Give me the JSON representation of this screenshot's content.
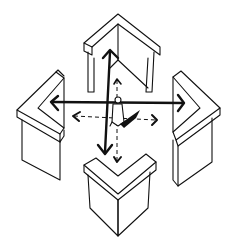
{
  "diagram": {
    "type": "sketch",
    "colors": {
      "line": "#111111",
      "background": "#ffffff"
    },
    "units": [
      {
        "id": "north",
        "position": "top"
      },
      {
        "id": "west",
        "position": "left"
      },
      {
        "id": "east",
        "position": "right"
      },
      {
        "id": "south",
        "position": "bottom"
      }
    ],
    "arrows": {
      "solid": [
        "up",
        "down",
        "left",
        "right"
      ],
      "dashed": [
        "up",
        "down",
        "left",
        "right"
      ]
    },
    "center": {
      "figure": "person"
    }
  }
}
